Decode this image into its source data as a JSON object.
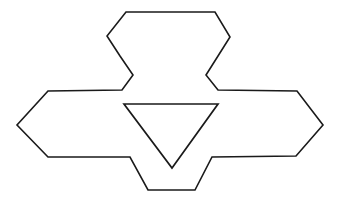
{
  "figure": {
    "title": "Geometric line figure",
    "style": "vintage line engraving",
    "background_color": "#ffffff",
    "stroke_color": "#1a1a1a",
    "stroke_width": 1.6,
    "canvas": {
      "width": 340,
      "height": 212
    },
    "shapes": [
      {
        "name": "outer-rosette-outline",
        "type": "polygon",
        "closed": true,
        "points": "126,12 215,12 230,37 218,56 206,75 218,90 297,91 323,125 296,156 212,157 195,190 148,190 130,157 48,157 17,125 48,91 122,90 133,75 120,56 107,36"
      },
      {
        "name": "inner-inverted-triangle",
        "type": "polygon",
        "closed": true,
        "points": "124,104 218,104 172,168"
      }
    ]
  },
  "chart_data": {
    "type": "table",
    "title": "Geometric line figure",
    "xlabel": "",
    "ylabel": "",
    "categories": [
      "outer-rosette-outline",
      "inner-inverted-triangle"
    ],
    "values": [
      20,
      3
    ],
    "annotations": [
      "Outer outline has 20 vertices",
      "Inner triangle has 3 vertices, apex pointing down"
    ]
  }
}
